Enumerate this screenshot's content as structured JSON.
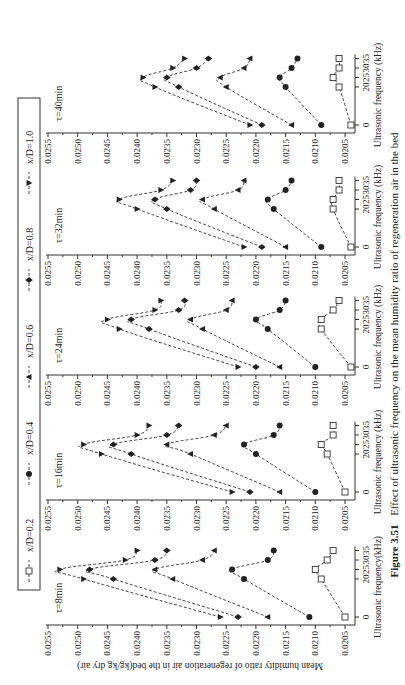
{
  "figure": {
    "caption_label": "Figure 3.51",
    "caption_text": "Effect of ultrasonic frequency on the mean humidity ratio of regeneration air in the bed",
    "rotation": "figure rotated 90° counter-clockwise on page"
  },
  "legend": {
    "items": [
      {
        "label": "x/D=0.2",
        "marker": "open-square"
      },
      {
        "label": "x/D=0.4",
        "marker": "filled-circle"
      },
      {
        "label": "x/D=0.6",
        "marker": "filled-triangle-up"
      },
      {
        "label": "x/D=0.8",
        "marker": "filled-diamond"
      },
      {
        "label": "x/D=1.0",
        "marker": "filled-triangle-down"
      }
    ]
  },
  "chart_data": {
    "type": "line",
    "title": "",
    "ylabel": "Mean humidity ratio of regeneration air in the bed(kg/kg dry air)",
    "xlabel": "Ultrasonic frequency (kHz)",
    "xlabel_first_panel": "Ultrasonic frequency(kHz)",
    "x": [
      0,
      20,
      25,
      30,
      35
    ],
    "x_ticks": [
      "0",
      "20",
      "25",
      "30",
      "35"
    ],
    "ylim": [
      0.0205,
      0.0255
    ],
    "y_ticks": [
      "0.0255",
      "0.0250",
      "0.0245",
      "0.0240",
      "0.0235",
      "0.0230",
      "0.0225",
      "0.0220",
      "0.0215",
      "0.0210",
      "0.0205"
    ],
    "grid": false,
    "legend_position": "top",
    "panels": [
      {
        "title": "τ=8min",
        "series": [
          {
            "name": "x/D=0.2",
            "values": [
              0.0205,
              0.0209,
              0.021,
              0.0208,
              0.0207
            ]
          },
          {
            "name": "x/D=0.4",
            "values": [
              0.0211,
              0.0222,
              0.0224,
              0.0218,
              0.0217
            ]
          },
          {
            "name": "x/D=0.6",
            "values": [
              0.0218,
              0.0234,
              0.0237,
              0.0229,
              0.0227
            ]
          },
          {
            "name": "x/D=0.8",
            "values": [
              0.0223,
              0.0244,
              0.0248,
              0.0237,
              0.0235
            ]
          },
          {
            "name": "x/D=1.0",
            "values": [
              0.0226,
              0.0249,
              0.0253,
              0.0242,
              0.024
            ]
          }
        ]
      },
      {
        "title": "τ=16min",
        "series": [
          {
            "name": "x/D=0.2",
            "values": [
              0.0205,
              0.0208,
              0.0209,
              0.0207,
              0.0207
            ]
          },
          {
            "name": "x/D=0.4",
            "values": [
              0.021,
              0.022,
              0.0222,
              0.0217,
              0.0216
            ]
          },
          {
            "name": "x/D=0.6",
            "values": [
              0.0216,
              0.0231,
              0.0235,
              0.0227,
              0.0225
            ]
          },
          {
            "name": "x/D=0.8",
            "values": [
              0.0221,
              0.0241,
              0.0244,
              0.0235,
              0.0233
            ]
          },
          {
            "name": "x/D=1.0",
            "values": [
              0.0224,
              0.0246,
              0.0249,
              0.024,
              0.0238
            ]
          }
        ]
      },
      {
        "title": "τ=24min",
        "series": [
          {
            "name": "x/D=0.2",
            "values": [
              0.0204,
              0.0209,
              0.0209,
              0.0207,
              0.0206
            ]
          },
          {
            "name": "x/D=0.4",
            "values": [
              0.021,
              0.0218,
              0.022,
              0.0216,
              0.0215
            ]
          },
          {
            "name": "x/D=0.6",
            "values": [
              0.0216,
              0.0229,
              0.0231,
              0.0225,
              0.0224
            ]
          },
          {
            "name": "x/D=0.8",
            "values": [
              0.022,
              0.0238,
              0.0241,
              0.0233,
              0.0232
            ]
          },
          {
            "name": "x/D=1.0",
            "values": [
              0.0223,
              0.0243,
              0.0245,
              0.0237,
              0.0236
            ]
          }
        ]
      },
      {
        "title": "τ=32min",
        "series": [
          {
            "name": "x/D=0.2",
            "values": [
              0.0204,
              0.0207,
              0.0207,
              0.0206,
              0.0206
            ]
          },
          {
            "name": "x/D=0.4",
            "values": [
              0.0209,
              0.0217,
              0.0218,
              0.0215,
              0.0214
            ]
          },
          {
            "name": "x/D=0.6",
            "values": [
              0.0215,
              0.0227,
              0.0229,
              0.0223,
              0.0222
            ]
          },
          {
            "name": "x/D=0.8",
            "values": [
              0.0219,
              0.0235,
              0.0237,
              0.0231,
              0.023
            ]
          },
          {
            "name": "x/D=1.0",
            "values": [
              0.0222,
              0.024,
              0.0243,
              0.0236,
              0.0234
            ]
          }
        ]
      },
      {
        "title": "τ=40min",
        "series": [
          {
            "name": "x/D=0.2",
            "values": [
              0.0204,
              0.0206,
              0.0207,
              0.0206,
              0.0206
            ]
          },
          {
            "name": "x/D=0.4",
            "values": [
              0.0209,
              0.0215,
              0.0216,
              0.0214,
              0.0213
            ]
          },
          {
            "name": "x/D=0.6",
            "values": [
              0.0214,
              0.0225,
              0.0226,
              0.0222,
              0.0221
            ]
          },
          {
            "name": "x/D=0.8",
            "values": [
              0.0219,
              0.0233,
              0.0235,
              0.023,
              0.0228
            ]
          },
          {
            "name": "x/D=1.0",
            "values": [
              0.0221,
              0.0237,
              0.0239,
              0.0234,
              0.0232
            ]
          }
        ]
      }
    ]
  }
}
